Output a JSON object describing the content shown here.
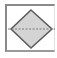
{
  "icon": {
    "name": "decision-diamond-shape",
    "colors": {
      "frame": "#8a8a8a",
      "diamond_fill": "#d4d4d4",
      "diamond_stroke": "#5a5a5a",
      "axis_line": "#7a7a7a"
    }
  }
}
